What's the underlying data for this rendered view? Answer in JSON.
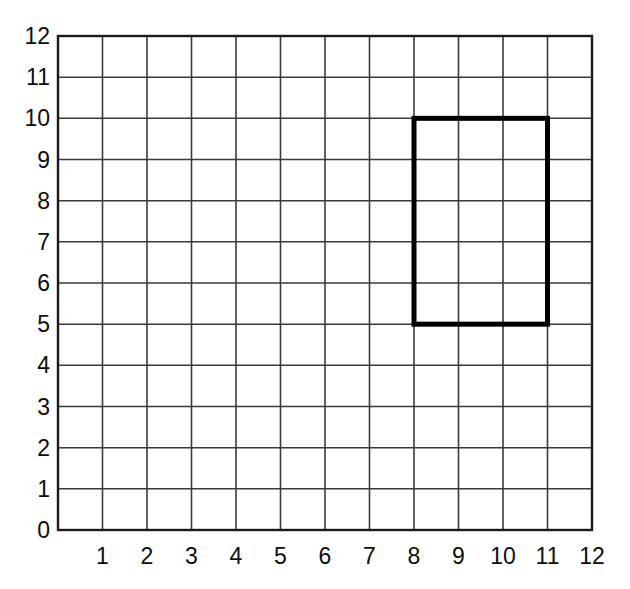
{
  "chart_data": {
    "type": "scatter",
    "title": "",
    "subtitle": "",
    "xlabel": "",
    "ylabel": "",
    "xlim": [
      0,
      12
    ],
    "ylim": [
      0,
      12
    ],
    "grid": true,
    "grid_step": 1,
    "legend": "none",
    "x_tick_labels": [
      "0",
      "1",
      "2",
      "3",
      "4",
      "5",
      "6",
      "7",
      "8",
      "9",
      "10",
      "11",
      "12"
    ],
    "y_tick_labels": [
      "0",
      "1",
      "2",
      "3",
      "4",
      "5",
      "6",
      "7",
      "8",
      "9",
      "10",
      "11",
      "12"
    ],
    "x_ticks": [
      0,
      1,
      2,
      3,
      4,
      5,
      6,
      7,
      8,
      9,
      10,
      11,
      12
    ],
    "y_ticks": [
      0,
      1,
      2,
      3,
      4,
      5,
      6,
      7,
      8,
      9,
      10,
      11,
      12
    ],
    "shapes": [
      {
        "name": "rectangle",
        "type": "rect",
        "x_min": 8,
        "x_max": 11,
        "y_min": 5,
        "y_max": 10,
        "width_units": 3,
        "height_units": 5,
        "vertices": [
          [
            8,
            10
          ],
          [
            11,
            10
          ],
          [
            11,
            5
          ],
          [
            8,
            5
          ]
        ],
        "stroke": "#000000",
        "stroke_width": 5,
        "fill": "none"
      }
    ],
    "annotations": []
  },
  "figure": {
    "background_color": "#ffffff",
    "grid_line_color": "#3a3a3a",
    "axis_line_color": "#1a1a1a",
    "tick_label_color": "#0d0d0d"
  }
}
